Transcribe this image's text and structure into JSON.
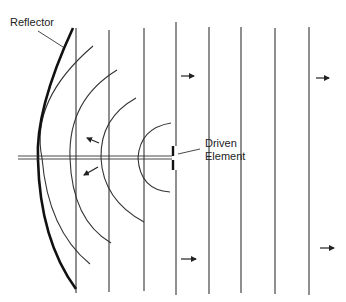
{
  "diagram": {
    "title": "",
    "labels": {
      "reflector": "Reflector",
      "driven_line1": "Driven",
      "driven_line2": "Element"
    },
    "colors": {
      "ink": "#222222",
      "background": "#ffffff"
    },
    "elements": [
      {
        "name": "reflector",
        "type": "curved-thick-line"
      },
      {
        "name": "driven-element",
        "type": "short-vertical-dipole"
      },
      {
        "name": "boom",
        "type": "horizontal-double-line"
      },
      {
        "name": "wavefronts-curved",
        "count": 4
      },
      {
        "name": "wavefronts-plane",
        "count": 8
      },
      {
        "name": "arrows",
        "directions": [
          "left-up",
          "left-down",
          "right",
          "right",
          "right",
          "right"
        ]
      }
    ]
  }
}
